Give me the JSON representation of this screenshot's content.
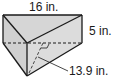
{
  "figure": {
    "type": "triangular-prism",
    "labels": {
      "length": "16 in.",
      "height": "5 in.",
      "slant": "13.9 in."
    },
    "colors": {
      "face_fill": "#d6d6d6",
      "edge": "#1a1a1a"
    }
  }
}
